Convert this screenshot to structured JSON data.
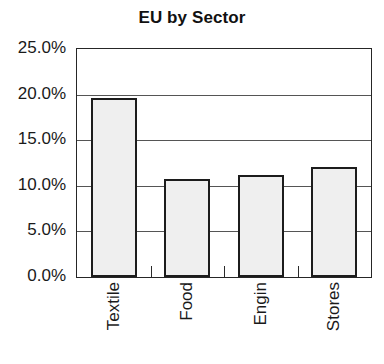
{
  "chart_data": {
    "type": "bar",
    "title": "EU by Sector",
    "xlabel": "",
    "ylabel": "",
    "categories": [
      "Textile",
      "Food",
      "Engin",
      "Stores"
    ],
    "values": [
      19.6,
      10.8,
      11.2,
      12.1
    ],
    "value_labels": [
      "19.6%",
      "10.8%",
      "11.2%",
      "12.1%"
    ],
    "ylim": [
      0,
      25
    ],
    "ytick_values": [
      0,
      5,
      10,
      15,
      20,
      25
    ],
    "ytick_labels": [
      "0.0%",
      "5.0%",
      "10.0%",
      "15.0%",
      "20.0%",
      "25.0%"
    ],
    "grid": true,
    "legend": false,
    "legend_position": "none",
    "bar_fill": "#d8d8d8",
    "bar_border": "#1c1c1c",
    "axis_color": "#262626",
    "background": "#ffffff",
    "units": "percent"
  }
}
